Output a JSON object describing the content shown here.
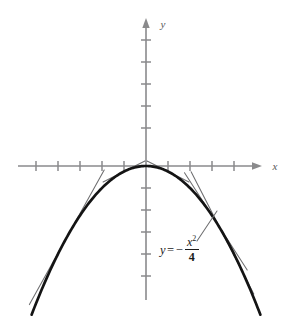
{
  "figure": {
    "kind": "line",
    "background_color": "#ffffff",
    "axis_color": "#8a8a8c",
    "curve_color": "#141414",
    "tangent_color": "#6e6e70",
    "leader_color": "#6e6e70"
  },
  "axes": {
    "x_axis_label": "x",
    "y_axis_label": "y",
    "origin_px": [
      146,
      166
    ],
    "x_axis_span_px": [
      18,
      262
    ],
    "y_axis_span_px": [
      18,
      300
    ],
    "tick_spacing_px": 22,
    "x_ticks_left_px": [
      36,
      58,
      80,
      102,
      124
    ],
    "x_ticks_right_px": [
      168,
      190,
      212,
      234
    ],
    "y_ticks_above_px": [
      40,
      62,
      84,
      106,
      128
    ],
    "y_ticks_below_px": [
      188,
      210,
      232,
      254,
      276
    ],
    "tick_half_len_px": 5,
    "arrow_x_tip_px": [
      262,
      166
    ],
    "arrow_y_tip_px": [
      146,
      18
    ]
  },
  "annotation": {
    "equation_y": "y",
    "equation_equals": "=",
    "equation_minus": "−",
    "equation_numerator": "x",
    "equation_exponent": "2",
    "equation_denominator": "4",
    "equation_plain": "y = - x^2 / 4",
    "leader_from_px": [
      198,
      240
    ],
    "leader_to_px": [
      216,
      212
    ]
  },
  "chart_data": {
    "type": "line",
    "title": "",
    "xlabel": "x",
    "ylabel": "y",
    "grid": false,
    "legend": "none",
    "equation": "y = -x^2/4",
    "coefficient_a": -0.25,
    "vertex": [
      0,
      0
    ],
    "x_unit_px": 22,
    "y_unit_px": 22,
    "xlim": [
      -5.8,
      5.3
    ],
    "ylim": [
      -6.7,
      6.7
    ],
    "series": [
      {
        "name": "parabola y = -x^2/4",
        "kind": "curve",
        "x": [
          -5.2,
          -4.5,
          -4.0,
          -3.5,
          -3.0,
          -2.5,
          -2.0,
          -1.5,
          -1.0,
          -0.5,
          0.0,
          0.5,
          1.0,
          1.5,
          2.0,
          2.5,
          3.0,
          3.5,
          4.0,
          4.5,
          5.2
        ],
        "y": [
          -6.76,
          -5.06,
          -4.0,
          -3.06,
          -2.25,
          -1.56,
          -1.0,
          -0.56,
          -0.25,
          -0.06,
          0.0,
          -0.06,
          -0.25,
          -0.56,
          -1.0,
          -1.56,
          -2.25,
          -3.06,
          -4.0,
          -5.06,
          -6.76
        ]
      },
      {
        "name": "tangent at x = -1",
        "kind": "tangent",
        "point": [
          -1.0,
          -0.25
        ],
        "slope": 0.5,
        "t_range": [
          -0.95,
          0.95
        ]
      },
      {
        "name": "tangent at x = 1",
        "kind": "tangent",
        "point": [
          1.0,
          -0.25
        ],
        "slope": -0.5,
        "t_range": [
          -0.95,
          0.95
        ]
      },
      {
        "name": "tangent at x = -3.6",
        "kind": "tangent",
        "point": [
          -3.6,
          -3.24
        ],
        "slope": 1.8,
        "t_range": [
          -1.7,
          1.7
        ]
      },
      {
        "name": "tangent at x = 3.1",
        "kind": "tangent",
        "point": [
          3.1,
          -2.4
        ],
        "slope": -1.55,
        "t_range": [
          -1.35,
          1.5
        ]
      },
      {
        "name": "tangent at x = 3.35",
        "kind": "tangent",
        "point": [
          3.35,
          -2.8
        ],
        "slope": -1.95,
        "t_range": [
          -1.3,
          1.55
        ]
      }
    ]
  }
}
